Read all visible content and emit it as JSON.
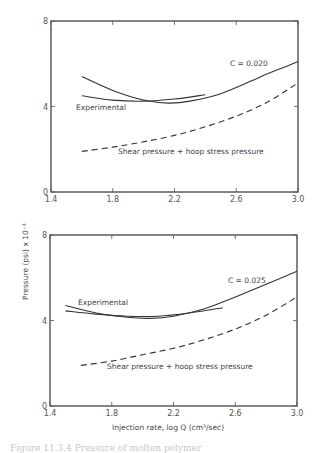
{
  "figure": {
    "ylabel": "Pressure (psi) x 10⁻³",
    "xlabel": "Injection rate, log Q (cm³/sec)",
    "caption": "Figure 11.3.4  Pressure of molten polymer"
  },
  "chart_data": [
    {
      "type": "line",
      "title": "",
      "xlabel": "Injection rate, log Q (cm³/sec)",
      "ylabel": "Pressure (psi) x 10⁻³",
      "xlim": [
        1.4,
        3.0
      ],
      "ylim": [
        0,
        8
      ],
      "xticks": [
        "1.4",
        "1.8",
        "2.2",
        "2.6",
        "3.0"
      ],
      "yticks": [
        "0",
        "4",
        "8"
      ],
      "grid": false,
      "series": [
        {
          "name": "C = 0.020",
          "style": "solid",
          "x": [
            1.6,
            1.8,
            2.0,
            2.16,
            2.3,
            2.5,
            2.7,
            2.79,
            2.88,
            3.0
          ],
          "y": [
            5.4,
            4.75,
            4.3,
            4.16,
            4.25,
            4.6,
            5.2,
            5.5,
            5.75,
            6.1
          ]
        },
        {
          "name": "Experimental",
          "style": "solid",
          "x": [
            1.6,
            1.8,
            2.0,
            2.2,
            2.4
          ],
          "y": [
            4.5,
            4.3,
            4.25,
            4.35,
            4.55
          ]
        },
        {
          "name": "Shear pressure + hoop stress pressure",
          "style": "dashed",
          "x": [
            1.6,
            1.8,
            2.0,
            2.2,
            2.4,
            2.6,
            2.8,
            3.0
          ],
          "y": [
            1.9,
            2.1,
            2.35,
            2.65,
            3.05,
            3.55,
            4.2,
            5.1
          ]
        }
      ],
      "annotations": [
        "C = 0.020",
        "Experimental",
        "Shear pressure + hoop stress pressure"
      ]
    },
    {
      "type": "line",
      "title": "",
      "xlabel": "Injection rate, log Q (cm³/sec)",
      "ylabel": "Pressure (psi) x 10⁻³",
      "xlim": [
        1.4,
        3.0
      ],
      "ylim": [
        0,
        8
      ],
      "xticks": [
        "1.4",
        "1.8",
        "2.2",
        "2.6",
        "3.0"
      ],
      "yticks": [
        "0",
        "4",
        "8"
      ],
      "grid": false,
      "series": [
        {
          "name": "C = 0.025",
          "style": "solid",
          "x": [
            1.5,
            1.7,
            1.9,
            2.05,
            2.2,
            2.4,
            2.6,
            2.8,
            3.0
          ],
          "y": [
            4.7,
            4.35,
            4.15,
            4.1,
            4.2,
            4.55,
            5.1,
            5.7,
            6.3
          ]
        },
        {
          "name": "Experimental",
          "style": "solid",
          "x": [
            1.5,
            1.7,
            1.9,
            2.1,
            2.3,
            2.52
          ],
          "y": [
            4.45,
            4.3,
            4.2,
            4.2,
            4.35,
            4.6
          ]
        },
        {
          "name": "Shear pressure + hoop stress pressure",
          "style": "dashed",
          "x": [
            1.6,
            1.8,
            2.0,
            2.2,
            2.4,
            2.6,
            2.8,
            3.0
          ],
          "y": [
            1.9,
            2.1,
            2.4,
            2.7,
            3.1,
            3.6,
            4.25,
            5.1
          ]
        }
      ],
      "annotations": [
        "C = 0.025",
        "Experimental",
        "Shear pressure + hoop stress pressure"
      ]
    }
  ],
  "labels": {
    "top": {
      "c_label": "C = 0.020",
      "exp_label": "Experimental",
      "dash_label": "Shear pressure + hoop stress pressure"
    },
    "bottom": {
      "c_label": "C = 0.025",
      "exp_label": "Experimental",
      "dash_label": "Shear pressure + hoop stress pressure"
    }
  }
}
